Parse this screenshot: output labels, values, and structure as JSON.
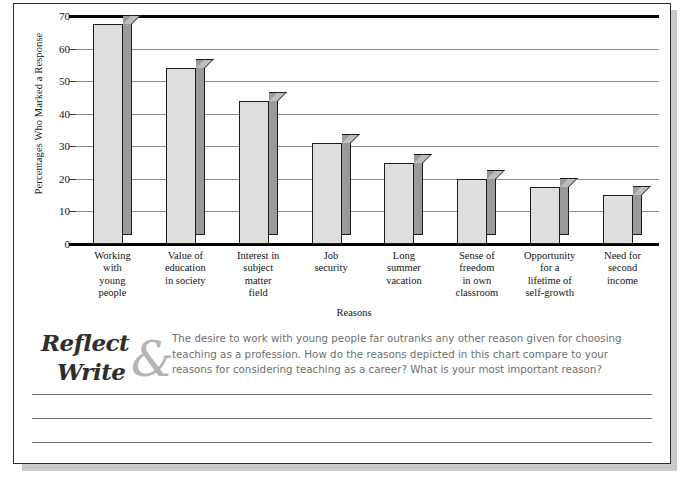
{
  "chart_data": {
    "type": "bar",
    "title": "",
    "xlabel": "Reasons",
    "ylabel": "Percentages Who Marked a Response",
    "ylim": [
      0,
      70
    ],
    "yticks": [
      0,
      10,
      20,
      30,
      40,
      50,
      60,
      70
    ],
    "grid": true,
    "legend": "none",
    "categories": [
      "Working\nwith\nyoung\npeople",
      "Value of\neducation\nin society",
      "Interest in\nsubject\nmatter\nfield",
      "Job\nsecurity",
      "Long\nsummer\nvacation",
      "Sense of\nfreedom\nin own\nclassroom",
      "Opportunity\nfor a\nlifetime of\nself-growth",
      "Need for\nsecond\nincome"
    ],
    "values": [
      67.5,
      54,
      44,
      31,
      25,
      20,
      17.5,
      15
    ],
    "series": [
      {
        "name": "Percentages Who Marked a Response",
        "values": [
          67.5,
          54,
          44,
          31,
          25,
          20,
          17.5,
          15
        ]
      }
    ]
  },
  "colors": {
    "bar_face": "#dedede",
    "bar_side": "#9a9a9a",
    "bar_top": "#bdbdbd",
    "bar_outline": "#1b1b1b",
    "gridline": "#8d8d8d",
    "axis": "#000000",
    "prompt_text": "#6f6f6f",
    "logo_script": "#2e2e2e",
    "logo_ampersand": "#b4b4b4",
    "page_border": "#2b2b2b",
    "page_shadow": "#c9c9c9"
  },
  "reflect_write": {
    "word_one": "Reflect",
    "ampersand": "&",
    "word_two": "Write",
    "prompt": "The desire to work with young people far outranks any other reason given for choosing teaching as a profession. How do the reasons depicted in this chart compare to your reasons for considering teaching as a career? What is your most important reason?"
  },
  "writing_lines": 3
}
